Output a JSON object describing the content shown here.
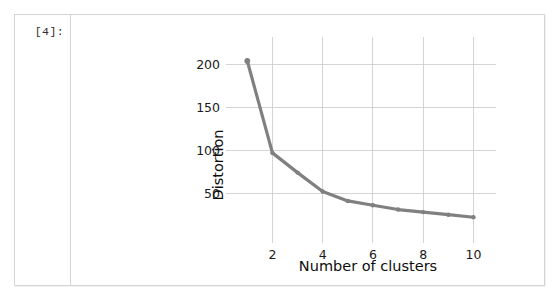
{
  "cell": {
    "output_prompt": "[4]:"
  },
  "chart_data": {
    "type": "line",
    "title": "",
    "xlabel": "Number of clusters",
    "ylabel": "Distortion",
    "x": [
      1,
      2,
      3,
      4,
      5,
      6,
      7,
      8,
      9,
      10
    ],
    "values": [
      204,
      97,
      74,
      52,
      41,
      36,
      31,
      28,
      25,
      22
    ],
    "series": [
      {
        "name": "Distortion",
        "values": [
          204,
          97,
          74,
          52,
          41,
          36,
          31,
          28,
          25,
          22
        ]
      }
    ],
    "xlim": [
      0.55,
      10.5
    ],
    "ylim": [
      6,
      218
    ],
    "xticks": [
      2,
      4,
      6,
      8,
      10
    ],
    "xtick_labels": [
      "2",
      "4",
      "6",
      "8",
      "10"
    ],
    "yticks": [
      50,
      100,
      150,
      200
    ],
    "ytick_labels": [
      "50",
      "100",
      "150",
      "200"
    ],
    "grid": true,
    "legend": false,
    "legend_position": "none",
    "marker": "circle",
    "colors": {
      "line": "#808080",
      "marker": "#808080",
      "grid": "#c9c9c9",
      "text": "#101010",
      "background": "#ffffff"
    }
  }
}
